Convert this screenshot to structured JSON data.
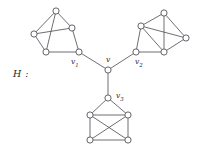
{
  "figure": {
    "graph_name": "H :",
    "background_color": "#ffffff",
    "edge_color": "#4a4a52",
    "node_fill": "#ffffff",
    "node_stroke": "#3c3c46"
  },
  "labels": {
    "hub": "v",
    "left_attach": "v",
    "left_attach_sub": "1",
    "right_attach": "v",
    "right_attach_sub": "2",
    "bottom_attach": "v",
    "bottom_attach_sub": "3"
  },
  "chart_data": {
    "type": "diagram",
    "title": "H :",
    "nodes": [
      {
        "id": "v",
        "x": 108,
        "y": 70,
        "label": "v"
      },
      {
        "id": "v1",
        "x": 79,
        "y": 52,
        "label": "v1"
      },
      {
        "id": "v2",
        "x": 136,
        "y": 52,
        "label": "v2"
      },
      {
        "id": "v3",
        "x": 108,
        "y": 98,
        "label": "v3"
      },
      {
        "id": "L1",
        "x": 56,
        "y": 11,
        "label": ""
      },
      {
        "id": "L2",
        "x": 34,
        "y": 34,
        "label": ""
      },
      {
        "id": "L3",
        "x": 72,
        "y": 28,
        "label": ""
      },
      {
        "id": "L4",
        "x": 46,
        "y": 52,
        "label": ""
      },
      {
        "id": "R1",
        "x": 164,
        "y": 13,
        "label": ""
      },
      {
        "id": "R2",
        "x": 141,
        "y": 26,
        "label": ""
      },
      {
        "id": "R3",
        "x": 186,
        "y": 38,
        "label": ""
      },
      {
        "id": "R4",
        "x": 164,
        "y": 52,
        "label": ""
      },
      {
        "id": "B1",
        "x": 90,
        "y": 115,
        "label": ""
      },
      {
        "id": "B2",
        "x": 128,
        "y": 115,
        "label": ""
      },
      {
        "id": "B3",
        "x": 90,
        "y": 140,
        "label": ""
      },
      {
        "id": "B4",
        "x": 128,
        "y": 140,
        "label": ""
      }
    ],
    "edges": [
      [
        "v",
        "v1"
      ],
      [
        "v",
        "v2"
      ],
      [
        "v",
        "v3"
      ],
      [
        "L1",
        "L2"
      ],
      [
        "L1",
        "L3"
      ],
      [
        "L1",
        "L4"
      ],
      [
        "L2",
        "L3"
      ],
      [
        "L2",
        "L4"
      ],
      [
        "L3",
        "v1"
      ],
      [
        "L4",
        "v1"
      ],
      [
        "R1",
        "R2"
      ],
      [
        "R1",
        "R3"
      ],
      [
        "R1",
        "R4"
      ],
      [
        "R2",
        "R3"
      ],
      [
        "R2",
        "R4"
      ],
      [
        "R3",
        "R4"
      ],
      [
        "R2",
        "v2"
      ],
      [
        "R4",
        "v2"
      ],
      [
        "v3",
        "B1"
      ],
      [
        "v3",
        "B2"
      ],
      [
        "B1",
        "B2"
      ],
      [
        "B1",
        "B3"
      ],
      [
        "B1",
        "B4"
      ],
      [
        "B2",
        "B3"
      ],
      [
        "B2",
        "B4"
      ],
      [
        "B3",
        "B4"
      ]
    ],
    "node_radius": 3.1
  }
}
